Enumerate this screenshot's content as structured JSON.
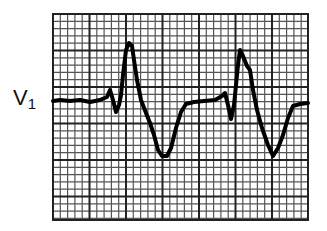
{
  "figure": {
    "lead": {
      "letter": "V",
      "number": "1"
    },
    "grid": {
      "left": 53,
      "top": 14,
      "right": 308,
      "bottom": 220,
      "minor_step": 7.3,
      "major_every": 5,
      "minor_color": "#555555",
      "major_color": "#222222"
    },
    "trace": {
      "color": "#000000",
      "points": [
        [
          53,
          101
        ],
        [
          60,
          100
        ],
        [
          70,
          101
        ],
        [
          80,
          100
        ],
        [
          90,
          102
        ],
        [
          100,
          100
        ],
        [
          107,
          97
        ],
        [
          110,
          90
        ],
        [
          113,
          100
        ],
        [
          116,
          112
        ],
        [
          119,
          105
        ],
        [
          121,
          95
        ],
        [
          123,
          75
        ],
        [
          126,
          50
        ],
        [
          129,
          43
        ],
        [
          132,
          46
        ],
        [
          134,
          60
        ],
        [
          137,
          80
        ],
        [
          141,
          100
        ],
        [
          146,
          113
        ],
        [
          150,
          123
        ],
        [
          154,
          135
        ],
        [
          158,
          150
        ],
        [
          162,
          156
        ],
        [
          167,
          156
        ],
        [
          171,
          148
        ],
        [
          176,
          128
        ],
        [
          181,
          112
        ],
        [
          186,
          104
        ],
        [
          194,
          102
        ],
        [
          204,
          101
        ],
        [
          215,
          100
        ],
        [
          222,
          96
        ],
        [
          225,
          93
        ],
        [
          228,
          105
        ],
        [
          231,
          119
        ],
        [
          234,
          105
        ],
        [
          236,
          85
        ],
        [
          238,
          65
        ],
        [
          240,
          50
        ],
        [
          243,
          56
        ],
        [
          247,
          66
        ],
        [
          250,
          70
        ],
        [
          253,
          90
        ],
        [
          257,
          110
        ],
        [
          262,
          128
        ],
        [
          268,
          145
        ],
        [
          273,
          156
        ],
        [
          278,
          148
        ],
        [
          283,
          135
        ],
        [
          288,
          118
        ],
        [
          293,
          106
        ],
        [
          300,
          104
        ],
        [
          308,
          103
        ]
      ]
    }
  }
}
